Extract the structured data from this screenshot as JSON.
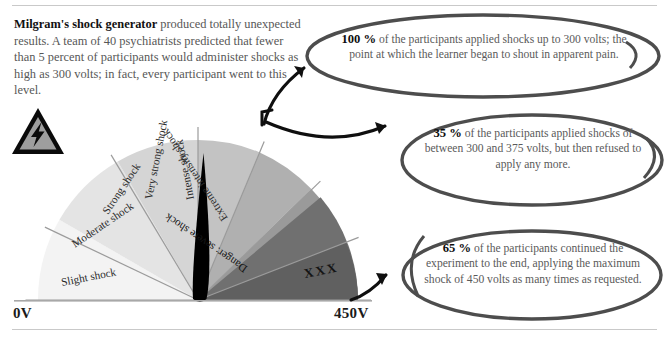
{
  "intro": {
    "lead": "Milgram's shock generator",
    "body": " produced totally unexpected results. A team of 40 psychiatrists predicted that fewer than 5 percent of participants would administer shocks as high as 300 volts; in fact, every participant went to this level."
  },
  "icons": {
    "warning": "high-voltage-warning-icon"
  },
  "gauge": {
    "min_label": "0V",
    "max_label": "450V",
    "needle_value_volts": 300,
    "segments": [
      {
        "label": "Slight shock",
        "color": "#f3f3f3"
      },
      {
        "label": "Moderate shock",
        "color": "#e4e4e4"
      },
      {
        "label": "Strong shock",
        "color": "#d5d5d5"
      },
      {
        "label": "Very strong shock",
        "color": "#c3c3c3"
      },
      {
        "label": "Intense shock",
        "color": "#b0b0b0"
      },
      {
        "label": "Extreme intensity shock",
        "color": "#9a9a9a"
      },
      {
        "label": "Danger: severe shock",
        "color": "#7f7f7f"
      },
      {
        "label": "XXX",
        "color": "#606060"
      }
    ]
  },
  "callouts": [
    {
      "id": "callout-100",
      "percent": "100 %",
      "text": " of the participants applied shocks up to 300 volts; the point at which the learner began to shout in apparent pain."
    },
    {
      "id": "callout-35",
      "percent": "35 %",
      "text": " of the participants applied shocks of between 300 and 375 volts, but then refused to apply any more."
    },
    {
      "id": "callout-65",
      "percent": "65 %",
      "text": " of the participants continued the experiment to the end, applying the maximum shock of 450 volts as many times as requested."
    }
  ],
  "colors": {
    "ink": "#1a1a1a",
    "body_text": "#575757",
    "rule": "#c9c9c9",
    "bubble_stroke": "#4d4d4d",
    "arrow": "#0f0f0f",
    "needle": "#000000"
  }
}
